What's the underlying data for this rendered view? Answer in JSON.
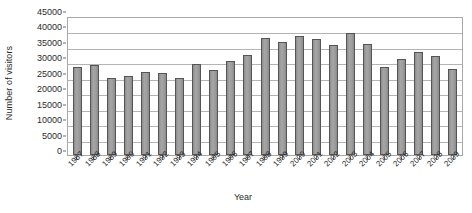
{
  "chart_data": {
    "type": "bar",
    "title": "",
    "xlabel": "Year",
    "ylabel": "Number of visitors",
    "ylim": [
      0,
      45000
    ],
    "ytick_step": 5000,
    "yticks": [
      "0",
      "5000",
      "10000",
      "15000",
      "20000",
      "25000",
      "30000",
      "35000",
      "40000",
      "45000"
    ],
    "ytick_values": [
      0,
      5000,
      10000,
      15000,
      20000,
      25000,
      30000,
      35000,
      40000,
      45000
    ],
    "grid": true,
    "legend": false,
    "bar_color": "#9a9a9a",
    "bar_border_color": "#555555",
    "gridline_color": "#b4b4b4",
    "axis_color": "#a8a8a8",
    "text_color": "#2b2b2b",
    "categories": [
      "1987",
      "1988",
      "1989",
      "1990",
      "1991",
      "1992",
      "1993",
      "1994",
      "1995",
      "1996",
      "1997",
      "1998",
      "1999",
      "2000",
      "2001",
      "2002",
      "2003",
      "2004",
      "2005",
      "2006",
      "2007",
      "2008",
      "2009"
    ],
    "values": [
      28500,
      29000,
      25000,
      25500,
      27000,
      26500,
      24800,
      29500,
      27500,
      30500,
      32500,
      38000,
      36500,
      38500,
      37500,
      35500,
      39500,
      36000,
      28500,
      31000,
      33500,
      32000,
      28000
    ]
  }
}
